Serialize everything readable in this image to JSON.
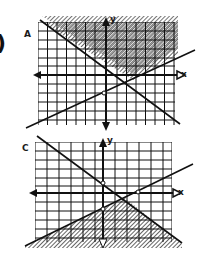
{
  "figure": {
    "left_mark": ")",
    "graphs": [
      {
        "label": "A",
        "x_axis_label": "x",
        "y_axis_label": "y",
        "shading": "above both lines",
        "lines": [
          {
            "name": "decreasing-line",
            "slope_sign": "negative"
          },
          {
            "name": "increasing-line",
            "slope_sign": "positive"
          }
        ]
      },
      {
        "label": "C",
        "x_axis_label": "x",
        "y_axis_label": "y",
        "shading": "below both lines",
        "lines": [
          {
            "name": "decreasing-line",
            "slope_sign": "negative"
          },
          {
            "name": "increasing-line",
            "slope_sign": "positive"
          }
        ]
      }
    ]
  },
  "colors": {
    "ink": "#111111",
    "background": "#ffffff"
  }
}
